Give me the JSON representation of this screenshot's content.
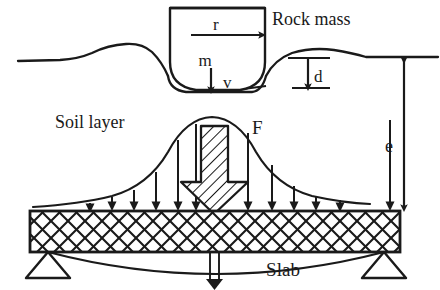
{
  "figure": {
    "type": "engineering-schematic",
    "background_color": "#ffffff",
    "line_color": "#1a1a1a"
  },
  "labels": {
    "rock_mass": "Rock mass",
    "soil_layer": "Soil layer",
    "slab": "Slab",
    "radius": "r",
    "mass": "m",
    "velocity": "v",
    "penetration_depth": "d",
    "cushion_thickness": "e",
    "impact_force": "F"
  },
  "elements": {
    "rock_mass_body": "rounded-bottom cylinder impactor",
    "ground_surface": "undulating soil surface line with ejecta mound",
    "crater": "impact crater depression",
    "pressure_curve": "bell-shaped distributed pressure diagram",
    "pressure_arrows": "downward load arrows onto slab top",
    "slab_body": "cross-hatched reinforced concrete slab",
    "left_support": "pin support triangle",
    "right_support": "pin support triangle",
    "deflection_curve": "sagging slab deflection line",
    "deflection_arrow": "midspan deflection arrow"
  },
  "geometry": {
    "slab": {
      "x": 30,
      "y": 211,
      "width": 370,
      "height": 41
    },
    "rock": {
      "x": 170,
      "y": 8,
      "width": 95,
      "height": 80
    },
    "supports": {
      "left_x": 48,
      "right_x": 384,
      "y": 252,
      "half_width": 22,
      "height": 26
    },
    "dimension_e": {
      "x": 404,
      "top_y": 57,
      "bottom_y": 211
    },
    "dimension_d": {
      "x": 308,
      "top_y": 60,
      "bottom_y": 88
    },
    "pressure_arrow_count": 12
  }
}
